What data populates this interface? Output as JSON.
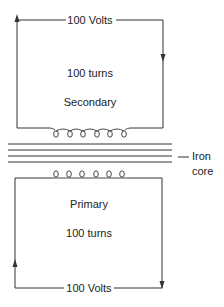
{
  "diagram": {
    "type": "transformer",
    "secondary": {
      "title": "Secondary",
      "turns_label": "100 turns",
      "voltage_label": "100 Volts",
      "coil_loops": 6
    },
    "primary": {
      "title": "Primary",
      "turns_label": "100 turns",
      "voltage_label": "100 Volts",
      "coil_loops": 6
    },
    "core": {
      "label_line1": "Iron",
      "label_line2": "core",
      "lamination_lines": 4
    },
    "colors": {
      "line": "#333333",
      "text": "#222222",
      "background": "#ffffff"
    }
  }
}
